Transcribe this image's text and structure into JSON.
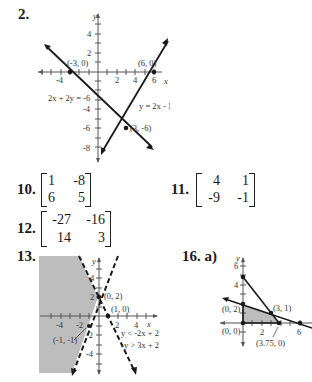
{
  "problems": {
    "p2": {
      "label": "2.",
      "points": [
        "(-3, 0)",
        "(6, 0)",
        "(3, -6)"
      ],
      "equations": [
        "2x + 2y = -6",
        "y = 2x - 12"
      ],
      "x_ticks": [
        "-4",
        "2",
        "4",
        "6"
      ],
      "y_ticks": [
        "4",
        "2",
        "-4",
        "-6",
        "-8"
      ],
      "x_axis_label": "x",
      "y_axis_label": "y"
    },
    "p10": {
      "label": "10.",
      "matrix": [
        [
          "1",
          "-8"
        ],
        [
          "6",
          "5"
        ]
      ]
    },
    "p11": {
      "label": "11.",
      "matrix": [
        [
          "4",
          "1"
        ],
        [
          "-9",
          "-1"
        ]
      ]
    },
    "p12": {
      "label": "12.",
      "matrix": [
        [
          "-27",
          "-16"
        ],
        [
          "14",
          "3"
        ]
      ]
    },
    "p13": {
      "label": "13.",
      "points": [
        "(0, 2)",
        "(1, 0)",
        "(-1, -1)"
      ],
      "inequalities": [
        "y < -2x + 2",
        "y > 3x + 2"
      ],
      "x_ticks": [
        "-4",
        "-2",
        "2",
        "4"
      ],
      "y_ticks": [
        "4",
        "2",
        "-2",
        "-4"
      ],
      "x_axis_label": "x",
      "y_axis_label": "y"
    },
    "p16": {
      "label": "16. a)",
      "points": [
        "(0, 2)",
        "(3, 1)",
        "(0, 0)",
        "(3.75, 0)"
      ],
      "x_ticks": [
        "2",
        "6"
      ],
      "y_ticks": [
        "6",
        "4"
      ],
      "y_axis_label": "y"
    }
  },
  "colors": {
    "ink": "#1a1a1a",
    "shade": "#bdbdbd",
    "axis": "#555555"
  }
}
